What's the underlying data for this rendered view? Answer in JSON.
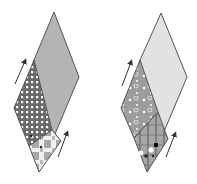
{
  "figure": {
    "colors": {
      "outline": "#555555",
      "arrow": "#333333",
      "left_large": "#b4b4b4",
      "left_dots_bg": "#6a6a6a",
      "left_dots": "#ffffff",
      "left_lower_bg": "#a8a8a8",
      "left_lower_light": "#efefef",
      "right_large": "#e2e2e2",
      "right_upper_bg": "#9c9c9c",
      "right_lower_bg": "#a6a6a6",
      "right_lower_lines": "#6e6e6e"
    },
    "diamonds": [
      {
        "name": "left-diamond",
        "top": [
          54,
          12
        ],
        "right": [
          79,
          77
        ],
        "bottom": [
          39,
          172
        ],
        "left": [
          14,
          108
        ],
        "arrows": [
          {
            "from": [
              15,
              84
            ],
            "to": [
              26,
              60
            ]
          },
          {
            "from": [
              58,
              157
            ],
            "to": [
              68,
              132
            ]
          }
        ]
      },
      {
        "name": "right-diamond",
        "top": [
          161,
          13
        ],
        "right": [
          187,
          77
        ],
        "bottom": [
          147,
          172
        ],
        "left": [
          121,
          108
        ],
        "arrows": [
          {
            "from": [
              122,
              86
            ],
            "to": [
              132,
              61
            ]
          },
          {
            "from": [
              166,
              157
            ],
            "to": [
              176,
              133
            ]
          }
        ]
      }
    ]
  }
}
